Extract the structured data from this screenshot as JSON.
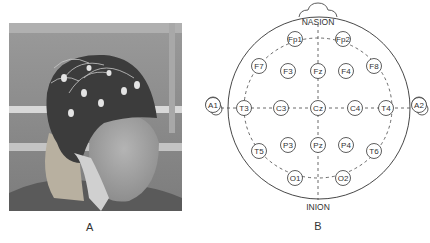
{
  "panels": {
    "a": {
      "label": "A",
      "caption": "Photo of subject wearing EEG electrode cap"
    },
    "b": {
      "label": "B",
      "caption": "International 10-20 electrode placement diagram"
    }
  },
  "diagram": {
    "top_landmark": "NASION",
    "bottom_landmark": "INION",
    "head": {
      "cx": 319,
      "cy": 108,
      "r": 91
    },
    "electrodes": [
      {
        "id": "Fp1",
        "x": 295,
        "y": 39
      },
      {
        "id": "Fp2",
        "x": 343,
        "y": 39
      },
      {
        "id": "F7",
        "x": 259,
        "y": 66
      },
      {
        "id": "F3",
        "x": 288,
        "y": 71
      },
      {
        "id": "Fz",
        "x": 318,
        "y": 71
      },
      {
        "id": "F4",
        "x": 346,
        "y": 71
      },
      {
        "id": "F8",
        "x": 374,
        "y": 66
      },
      {
        "id": "T3",
        "x": 244,
        "y": 108
      },
      {
        "id": "C3",
        "x": 281,
        "y": 108
      },
      {
        "id": "Cz",
        "x": 318,
        "y": 108
      },
      {
        "id": "C4",
        "x": 355,
        "y": 108
      },
      {
        "id": "T4",
        "x": 386,
        "y": 108
      },
      {
        "id": "T5",
        "x": 259,
        "y": 151
      },
      {
        "id": "P3",
        "x": 288,
        "y": 145
      },
      {
        "id": "Pz",
        "x": 318,
        "y": 145
      },
      {
        "id": "P4",
        "x": 346,
        "y": 145
      },
      {
        "id": "T6",
        "x": 374,
        "y": 151
      },
      {
        "id": "O1",
        "x": 295,
        "y": 178
      },
      {
        "id": "O2",
        "x": 343,
        "y": 178
      }
    ],
    "ears": [
      {
        "id": "A1",
        "x": 213,
        "y": 105
      },
      {
        "id": "A2",
        "x": 419,
        "y": 105
      }
    ]
  }
}
